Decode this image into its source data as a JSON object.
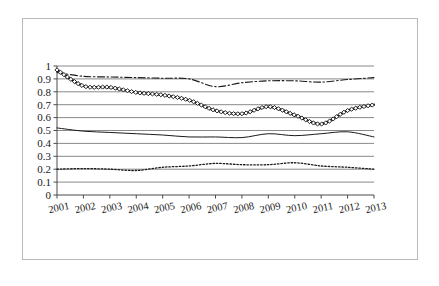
{
  "chart_data": {
    "type": "line",
    "title": "",
    "subtitle": "",
    "xlabel": "",
    "ylabel": "",
    "categories": [
      "2001",
      "2002",
      "2003",
      "2004",
      "2005",
      "2006",
      "2007",
      "2008",
      "2009",
      "2010",
      "2011",
      "2012",
      "2013"
    ],
    "x_tick_labels": [
      "2001",
      "2002",
      "2003",
      "2004",
      "2005",
      "2006",
      "2007",
      "2008",
      "2009",
      "2010",
      "2011",
      "2012",
      "2013"
    ],
    "y_tick_labels": [
      "0",
      "0.1",
      "0.2",
      "0.3",
      "0.4",
      "0.5",
      "0.6",
      "0.7",
      "0.8",
      "0.9",
      "1"
    ],
    "y_tick_values": [
      0,
      0.1,
      0.2,
      0.3,
      0.4,
      0.5,
      0.6,
      0.7,
      0.8,
      0.9,
      1
    ],
    "ylim": [
      0,
      1
    ],
    "xlim": [
      "2001",
      "2013"
    ],
    "grid": "horizontal",
    "legend": "none",
    "legend_position": "none",
    "annotations": [],
    "series": [
      {
        "name": "series-dash-dot-upper",
        "style": "dash-dot",
        "marker": "none",
        "color": "#1a1a1a",
        "values": [
          0.95,
          0.92,
          0.915,
          0.91,
          0.905,
          0.9,
          0.84,
          0.87,
          0.885,
          0.885,
          0.875,
          0.895,
          0.91
        ]
      },
      {
        "name": "series-diamond-markers",
        "style": "solid-thick",
        "marker": "diamond",
        "color": "#111111",
        "values": [
          0.97,
          0.845,
          0.835,
          0.795,
          0.775,
          0.735,
          0.655,
          0.63,
          0.685,
          0.62,
          0.55,
          0.655,
          0.7
        ]
      },
      {
        "name": "series-solid-mid",
        "style": "solid-thin",
        "marker": "none",
        "color": "#2a2a2a",
        "values": [
          0.52,
          0.495,
          0.485,
          0.475,
          0.465,
          0.45,
          0.45,
          0.445,
          0.475,
          0.46,
          0.475,
          0.49,
          0.45
        ]
      },
      {
        "name": "series-dotted-lower",
        "style": "dotted",
        "marker": "none",
        "color": "#1a1a1a",
        "values": [
          0.2,
          0.205,
          0.2,
          0.19,
          0.215,
          0.225,
          0.245,
          0.235,
          0.235,
          0.25,
          0.225,
          0.215,
          0.2
        ]
      }
    ]
  },
  "figure": {
    "border_color": "#b9b9b9",
    "background": "#ffffff"
  }
}
